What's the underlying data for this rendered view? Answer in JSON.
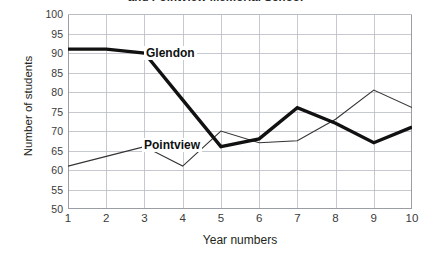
{
  "chart_data": {
    "type": "line",
    "title": "and Pointview Memorial School",
    "xlabel": "Year numbers",
    "ylabel": "Number of students",
    "x": [
      1,
      2,
      3,
      4,
      5,
      6,
      7,
      8,
      9,
      10
    ],
    "xticklabels": [
      "1",
      "2",
      "3",
      "4",
      "5",
      "6",
      "7",
      "8",
      "9",
      "10"
    ],
    "yticklabels": [
      "50",
      "55",
      "60",
      "65",
      "70",
      "75",
      "80",
      "85",
      "90",
      "95",
      "100"
    ],
    "yticks": [
      50,
      55,
      60,
      65,
      70,
      75,
      80,
      85,
      90,
      95,
      100
    ],
    "xlim": [
      1,
      10
    ],
    "ylim": [
      50,
      100
    ],
    "grid": true,
    "legend": "inline-annotations",
    "series": [
      {
        "name": "Glendon",
        "style": "thick",
        "color": "#111111",
        "values": [
          91,
          91,
          90,
          78,
          66,
          68,
          76,
          72,
          67,
          71
        ]
      },
      {
        "name": "Pointview",
        "style": "thin",
        "color": "#333333",
        "values": [
          61,
          63.5,
          66,
          61,
          70,
          67,
          67.5,
          73,
          80.5,
          76
        ]
      }
    ],
    "annotations": [
      {
        "text": "Glendon",
        "x": 1.6,
        "y": 95
      },
      {
        "text": "Pointview",
        "x": 1.5,
        "y": 71
      }
    ]
  },
  "colors": {
    "grid": "#b9bcc4",
    "axis": "#9a9da4",
    "glendon": "#111111",
    "pointview": "#333333",
    "text": "#231f20",
    "background": "#ffffff"
  }
}
